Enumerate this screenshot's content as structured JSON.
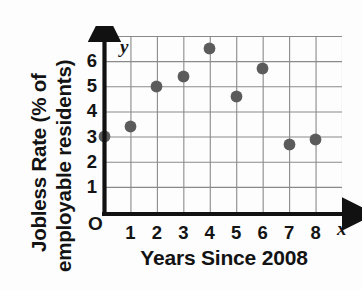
{
  "figure": {
    "kind": "scatter-plot",
    "background_color": "#ffffff",
    "ink_color": "#141414",
    "point_color": "#5b5b5b",
    "grid_color": "#8a8a8a"
  },
  "axis_names": {
    "y_axis_arrow_label": "y",
    "x_axis_arrow_label": "x",
    "origin_label": "O"
  },
  "labels": {
    "y_axis_title_line1": "Jobless Rate (% of",
    "y_axis_title_line2": "employable residents)",
    "x_axis_title": "Years Since 2008"
  },
  "ticks": {
    "y": [
      "1",
      "2",
      "3",
      "4",
      "5",
      "6"
    ],
    "x": [
      "1",
      "2",
      "3",
      "4",
      "5",
      "6",
      "7",
      "8"
    ]
  },
  "chart_data": {
    "type": "scatter",
    "title": "",
    "subtitle": "",
    "xlabel": "Years Since 2008",
    "ylabel": "Jobless Rate (% of employable residents)",
    "xlim": [
      0,
      9
    ],
    "ylim": [
      0,
      7
    ],
    "xticks": [
      0,
      1,
      2,
      3,
      4,
      5,
      6,
      7,
      8
    ],
    "yticks": [
      1,
      2,
      3,
      4,
      5,
      6
    ],
    "xtick_labels": [
      "O",
      "1",
      "2",
      "3",
      "4",
      "5",
      "6",
      "7",
      "8"
    ],
    "ytick_labels": [
      "1",
      "2",
      "3",
      "4",
      "5",
      "6"
    ],
    "grid": true,
    "legend": false,
    "legend_position": "none",
    "marker": "filled-circle",
    "x": [
      0,
      1,
      2,
      3,
      4,
      5,
      6,
      7,
      8
    ],
    "y": [
      3.0,
      3.4,
      5.0,
      5.4,
      6.5,
      4.6,
      5.7,
      2.7,
      2.9
    ],
    "points": [
      {
        "x": 0,
        "y": 3.0
      },
      {
        "x": 1,
        "y": 3.4
      },
      {
        "x": 2,
        "y": 5.0
      },
      {
        "x": 3,
        "y": 5.4
      },
      {
        "x": 4,
        "y": 6.5
      },
      {
        "x": 5,
        "y": 4.6
      },
      {
        "x": 6,
        "y": 5.7
      },
      {
        "x": 7,
        "y": 2.7
      },
      {
        "x": 8,
        "y": 2.9
      }
    ]
  }
}
